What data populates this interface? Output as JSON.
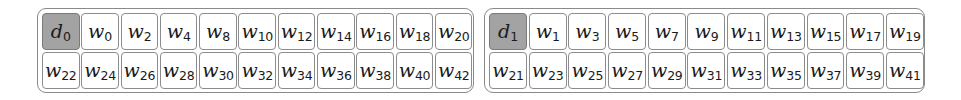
{
  "panels": [
    {
      "head": {
        "symbol": "d",
        "sub": "0"
      },
      "row1": [
        {
          "symbol": "w",
          "sub": "0"
        },
        {
          "symbol": "w",
          "sub": "2"
        },
        {
          "symbol": "w",
          "sub": "4"
        },
        {
          "symbol": "w",
          "sub": "8"
        },
        {
          "symbol": "w",
          "sub": "10"
        },
        {
          "symbol": "w",
          "sub": "12"
        },
        {
          "symbol": "w",
          "sub": "14"
        },
        {
          "symbol": "w",
          "sub": "16"
        },
        {
          "symbol": "w",
          "sub": "18"
        },
        {
          "symbol": "w",
          "sub": "20"
        }
      ],
      "row2": [
        {
          "symbol": "w",
          "sub": "22"
        },
        {
          "symbol": "w",
          "sub": "24"
        },
        {
          "symbol": "w",
          "sub": "26"
        },
        {
          "symbol": "w",
          "sub": "28"
        },
        {
          "symbol": "w",
          "sub": "30"
        },
        {
          "symbol": "w",
          "sub": "32"
        },
        {
          "symbol": "w",
          "sub": "34"
        },
        {
          "symbol": "w",
          "sub": "36"
        },
        {
          "symbol": "w",
          "sub": "38"
        },
        {
          "symbol": "w",
          "sub": "40"
        },
        {
          "symbol": "w",
          "sub": "42"
        }
      ]
    },
    {
      "head": {
        "symbol": "d",
        "sub": "1"
      },
      "row1": [
        {
          "symbol": "w",
          "sub": "1"
        },
        {
          "symbol": "w",
          "sub": "3"
        },
        {
          "symbol": "w",
          "sub": "5"
        },
        {
          "symbol": "w",
          "sub": "7"
        },
        {
          "symbol": "w",
          "sub": "9"
        },
        {
          "symbol": "w",
          "sub": "11"
        },
        {
          "symbol": "w",
          "sub": "13"
        },
        {
          "symbol": "w",
          "sub": "15"
        },
        {
          "symbol": "w",
          "sub": "17"
        },
        {
          "symbol": "w",
          "sub": "19"
        }
      ],
      "row2": [
        {
          "symbol": "w",
          "sub": "21"
        },
        {
          "symbol": "w",
          "sub": "23"
        },
        {
          "symbol": "w",
          "sub": "25"
        },
        {
          "symbol": "w",
          "sub": "27"
        },
        {
          "symbol": "w",
          "sub": "29"
        },
        {
          "symbol": "w",
          "sub": "31"
        },
        {
          "symbol": "w",
          "sub": "33"
        },
        {
          "symbol": "w",
          "sub": "35"
        },
        {
          "symbol": "w",
          "sub": "37"
        },
        {
          "symbol": "w",
          "sub": "39"
        },
        {
          "symbol": "w",
          "sub": "41"
        }
      ]
    }
  ],
  "colors": {
    "head_fill": "#a3a3a3",
    "cell_fill": "#ffffff",
    "border": "#8a8a8a"
  }
}
